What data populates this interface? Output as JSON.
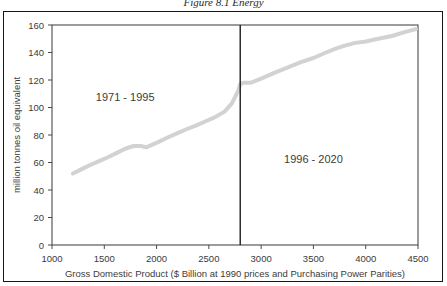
{
  "figure": {
    "caption_partial": "Figure 8.1  Energy",
    "border_color": "#161616",
    "background": "#ffffff"
  },
  "chart_data": {
    "type": "line",
    "title": "",
    "xlabel": "Gross Domestic Product ($ Billion at 1990 prices and Purchasing Power Parities)",
    "ylabel": "million tonnes oil equivalent",
    "xlim": [
      1000,
      4500
    ],
    "ylim": [
      0,
      160
    ],
    "xticks": [
      1000,
      1500,
      2000,
      2500,
      3000,
      3500,
      4000,
      4500
    ],
    "yticks": [
      0,
      20,
      40,
      60,
      80,
      100,
      120,
      140,
      160
    ],
    "grid": false,
    "legend": false,
    "line_color": "#d2d2d2",
    "line_width": 4,
    "series": [
      {
        "name": "Energy consumption vs GDP",
        "x": [
          1200,
          1280,
          1360,
          1450,
          1540,
          1620,
          1700,
          1780,
          1850,
          1900,
          1960,
          2020,
          2100,
          2190,
          2280,
          2380,
          2470,
          2560,
          2650,
          2720,
          2780,
          2800,
          2830,
          2900,
          3000,
          3120,
          3250,
          3380,
          3500,
          3620,
          3720,
          3800,
          3900,
          4000,
          4120,
          4250,
          4380,
          4480
        ],
        "y": [
          52,
          55,
          58,
          61,
          64,
          67,
          70,
          72,
          72,
          71,
          73,
          75,
          78,
          81,
          84,
          87,
          90,
          93,
          97,
          103,
          112,
          117,
          118,
          118,
          121,
          125,
          129,
          133,
          136,
          140,
          143,
          145,
          147,
          148,
          150,
          152,
          155,
          157
        ]
      }
    ],
    "annotations": [
      {
        "text": "1971 - 1995",
        "x": 1700,
        "y": 105,
        "name": "period-label-historical"
      },
      {
        "text": "1996 - 2020",
        "x": 3500,
        "y": 60,
        "name": "period-label-projection"
      }
    ],
    "divider": {
      "x": 2800,
      "color": "#1e1e1e",
      "name": "period-divider-line"
    }
  }
}
